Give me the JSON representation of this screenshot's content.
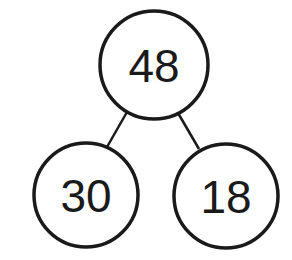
{
  "diagram": {
    "type": "number-bond",
    "whole": {
      "value": "48",
      "cx": 154,
      "cy": 65,
      "r": 54
    },
    "parts": [
      {
        "value": "30",
        "cx": 86,
        "cy": 195,
        "r": 52
      },
      {
        "value": "18",
        "cx": 226,
        "cy": 196,
        "r": 52
      }
    ],
    "colors": {
      "stroke": "#1a1a1a",
      "fill": "#ffffff",
      "text": "#1a1a1a"
    }
  }
}
